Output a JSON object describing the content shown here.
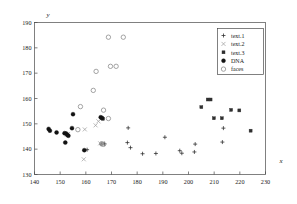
{
  "chart_data": {
    "type": "scatter",
    "title": "",
    "xlabel": "x",
    "ylabel": "y",
    "xlim": [
      140,
      230
    ],
    "ylim": [
      130,
      190
    ],
    "xticks": [
      140,
      150,
      160,
      170,
      180,
      190,
      200,
      210,
      220,
      230
    ],
    "yticks": [
      130,
      140,
      150,
      160,
      170,
      180,
      190
    ],
    "grid": false,
    "legend_position": "top-right",
    "series": [
      {
        "name": "text.1",
        "marker": "plus",
        "color": "#2a2a2a",
        "points": [
          [
            160.5,
            139.8
          ],
          [
            166.0,
            142.0
          ],
          [
            167.3,
            142.1
          ],
          [
            176.5,
            148.4
          ],
          [
            176.2,
            142.6
          ],
          [
            177.4,
            140.6
          ],
          [
            182.1,
            138.2
          ],
          [
            187.3,
            138.3
          ],
          [
            190.8,
            144.7
          ],
          [
            196.6,
            139.4
          ],
          [
            197.4,
            138.4
          ],
          [
            202.3,
            138.9
          ],
          [
            202.6,
            142.0
          ],
          [
            213.6,
            148.3
          ],
          [
            213.2,
            142.8
          ]
        ]
      },
      {
        "name": "text.2",
        "marker": "cross",
        "color": "#9a9a9a",
        "points": [
          [
            159.2,
            136.0
          ],
          [
            159.6,
            147.8
          ],
          [
            163.8,
            149.4
          ],
          [
            164.9,
            151.0
          ],
          [
            165.6,
            142.3
          ],
          [
            166.6,
            142.3
          ],
          [
            166.1,
            152.1
          ],
          [
            152.6,
            145.8
          ],
          [
            153.1,
            146.0
          ]
        ]
      },
      {
        "name": "text.3",
        "marker": "square",
        "color": "#2f2f2f",
        "points": [
          [
            205.0,
            156.6
          ],
          [
            207.5,
            159.6
          ],
          [
            208.6,
            159.6
          ],
          [
            209.9,
            152.2
          ],
          [
            213.0,
            152.2
          ],
          [
            216.6,
            155.5
          ],
          [
            219.8,
            155.3
          ],
          [
            224.2,
            147.3
          ],
          [
            166.7,
            152.0
          ]
        ]
      },
      {
        "name": "DNA",
        "marker": "dot",
        "color": "#121212",
        "points": [
          [
            145.5,
            148.0
          ],
          [
            146.0,
            147.3
          ],
          [
            148.6,
            146.6
          ],
          [
            151.7,
            146.3
          ],
          [
            152.3,
            146.2
          ],
          [
            152.0,
            142.6
          ],
          [
            152.8,
            145.6
          ],
          [
            153.2,
            145.3
          ],
          [
            154.6,
            148.3
          ],
          [
            155.0,
            153.8
          ],
          [
            159.4,
            139.6
          ],
          [
            165.8,
            152.6
          ],
          [
            166.3,
            152.3
          ]
        ]
      },
      {
        "name": "faces",
        "marker": "circle",
        "color": "#8d8d8d",
        "points": [
          [
            168.8,
            184.2
          ],
          [
            174.6,
            184.2
          ],
          [
            169.6,
            172.7
          ],
          [
            171.8,
            172.7
          ],
          [
            164.0,
            170.7
          ],
          [
            162.9,
            163.2
          ],
          [
            157.9,
            156.8
          ],
          [
            166.9,
            155.4
          ],
          [
            168.8,
            152.1
          ],
          [
            156.9,
            147.7
          ],
          [
            166.2,
            142.1
          ],
          [
            166.9,
            141.9
          ]
        ]
      }
    ]
  },
  "legend": {
    "entries": [
      {
        "label": "text.1",
        "marker": "plus"
      },
      {
        "label": "text.2",
        "marker": "cross"
      },
      {
        "label": "text.3",
        "marker": "square"
      },
      {
        "label": "DNA",
        "marker": "dot"
      },
      {
        "label": "faces",
        "marker": "circle"
      }
    ]
  }
}
